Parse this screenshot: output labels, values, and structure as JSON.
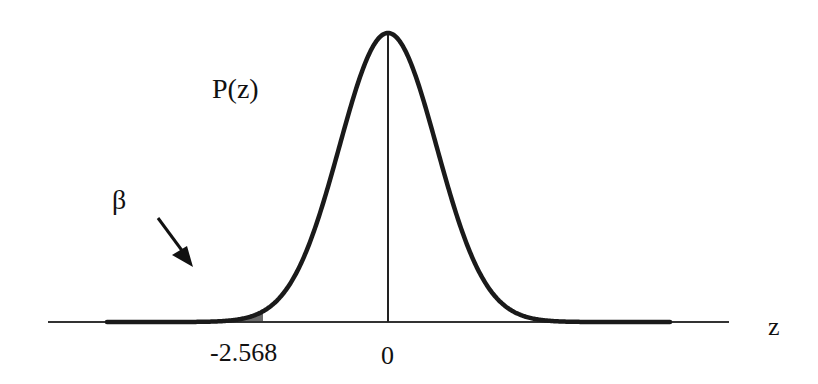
{
  "figure": {
    "curve_label": "P(z)",
    "area_label": "β",
    "axis_label": "z",
    "ticks": [
      {
        "label": "-2.568",
        "value": -2.568
      },
      {
        "label": "0",
        "value": 0
      }
    ],
    "colors": {
      "curve": "#1a1a1a",
      "shade": "#6b6b6b",
      "axis": "#333333"
    }
  },
  "chart_data": {
    "type": "area",
    "title": "",
    "xlabel": "z",
    "ylabel": "P(z)",
    "curve": "standard normal density",
    "shaded_region": {
      "from": "-inf",
      "to": -2.568,
      "label": "β"
    },
    "tick_labels": [
      "-2.568",
      "0"
    ],
    "vertical_line_at": 0,
    "grid": false,
    "legend": "none"
  }
}
